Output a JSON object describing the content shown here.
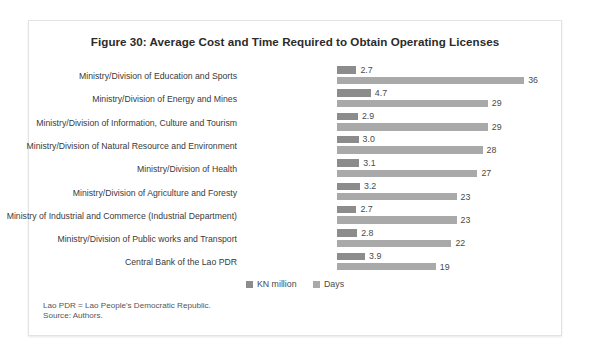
{
  "figure": {
    "title": "Figure 30: Average Cost and Time Required to Obtain Operating Licenses",
    "notes": {
      "abbreviation": "Lao PDR = Lao People's Democratic Republic.",
      "source": "Source: Authors."
    }
  },
  "legend": {
    "kn_label": "KN million",
    "days_label": "Days"
  },
  "colors": {
    "kn_million": "#8c8c8c",
    "days": "#a9a9a9",
    "frame_border": "#e3e3e3",
    "title_text": "#2b2b2b",
    "label_text": "#3a3a3a"
  },
  "chart_data": {
    "type": "bar",
    "orientation": "horizontal",
    "title": "Figure 30: Average Cost and Time Required to Obtain Operating Licenses",
    "xlabel": "",
    "ylabel": "",
    "grid": false,
    "legend_position": "bottom",
    "categories": [
      "Ministry/Division of Education and Sports",
      "Ministry/Division of Energy and Mines",
      "Ministry/Division of Information, Culture and Tourism",
      "Ministry/Division of Natural Resource and Environment",
      "Ministry/Division of Health",
      "Ministry/Division of Agriculture and Foresty",
      "Ministry of Industrial and Commerce (Industrial Department)",
      "Ministry/Division of Public works and Transport",
      "Central Bank of the Lao PDR"
    ],
    "series": [
      {
        "name": "KN million",
        "values": [
          2.7,
          4.7,
          2.9,
          3.0,
          3.1,
          3.2,
          2.7,
          2.8,
          3.9
        ],
        "labels": [
          "2.7",
          "4.7",
          "2.9",
          "3.0",
          "3.1",
          "3.2",
          "2.7",
          "2.8",
          "3.9"
        ],
        "color": "#8c8c8c"
      },
      {
        "name": "Days",
        "values": [
          36,
          29,
          29,
          28,
          27,
          23,
          23,
          22,
          19
        ],
        "labels": [
          "36",
          "29",
          "29",
          "28",
          "27",
          "23",
          "23",
          "22",
          "19"
        ],
        "color": "#a9a9a9"
      }
    ]
  }
}
